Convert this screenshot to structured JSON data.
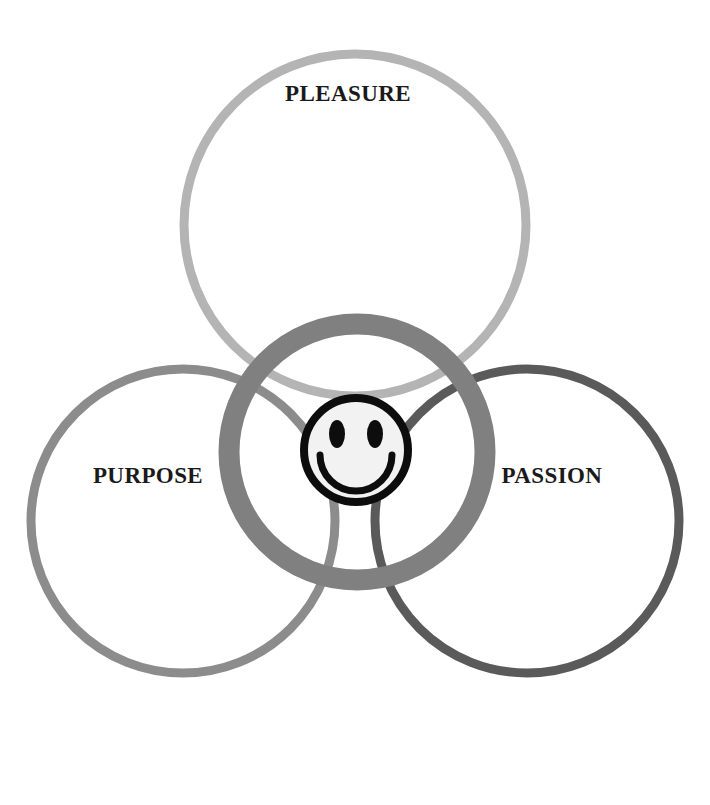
{
  "diagram": {
    "type": "venn",
    "title": "",
    "background_color": "#ffffff",
    "circles": [
      {
        "id": "pleasure",
        "label": "PLEASURE",
        "color": "#b4b4b4",
        "cx": 355,
        "cy": 225,
        "r": 171,
        "stroke_width": 9,
        "label_x": 348,
        "label_y": 96
      },
      {
        "id": "purpose",
        "label": "PURPOSE",
        "color": "#8c8c8c",
        "cx": 183,
        "cy": 521,
        "r": 152,
        "stroke_width": 9,
        "label_x": 148,
        "label_y": 478
      },
      {
        "id": "passion",
        "label": "PASSION",
        "color": "#5a5a5a",
        "cx": 527,
        "cy": 521,
        "r": 152,
        "stroke_width": 9,
        "label_x": 552,
        "label_y": 478
      }
    ],
    "center": {
      "id": "center-ring",
      "label": "",
      "color": "#808080",
      "cx": 357,
      "cy": 452,
      "r": 128,
      "stroke_width": 21
    },
    "smiley": {
      "id": "smiley-face",
      "cx": 356,
      "cy": 450,
      "r": 52,
      "outline_color": "#0d0d0d",
      "outline_width": 8,
      "fill_color": "#f2f2f2",
      "eye_color": "#0d0d0d",
      "eye_offset_x": 19,
      "eye_offset_y": -16,
      "eye_rx": 8,
      "eye_ry": 14,
      "mouth_color": "#0d0d0d",
      "mouth_width": 7
    }
  },
  "labels": {
    "pleasure": "PLEASURE",
    "purpose": "PURPOSE",
    "passion": "PASSION"
  }
}
